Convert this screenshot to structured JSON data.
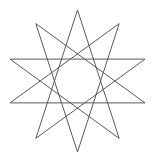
{
  "figure": {
    "shape_kind": "star-polygon",
    "point_count": 10,
    "component_polygons": 2,
    "points_per_polygon": 5,
    "polygon_step": 2,
    "rotation_offset_degrees": 36,
    "background_color": "#ffffff",
    "stroke_color": "#5a5a5a",
    "stroke_width_px": 1,
    "fill": "none",
    "geometry": {
      "center_x": 77.5,
      "center_y": 81,
      "outer_radius": 71,
      "start_angle_degrees": -90,
      "canvas_width": 155,
      "canvas_height": 159
    },
    "vertices": [
      {
        "index": 0,
        "angle": -90,
        "x": 77.5,
        "y": 10.0,
        "label": "top-apex"
      },
      {
        "index": 1,
        "angle": -54,
        "x": 119.2,
        "y": 23.6,
        "label": "upper-right"
      },
      {
        "index": 2,
        "angle": -18,
        "x": 145.0,
        "y": 59.1,
        "label": "right-upper"
      },
      {
        "index": 3,
        "angle": 18,
        "x": 145.0,
        "y": 102.9,
        "label": "right-lower"
      },
      {
        "index": 4,
        "angle": 54,
        "x": 119.2,
        "y": 138.4,
        "label": "lower-right"
      },
      {
        "index": 5,
        "angle": 90,
        "x": 77.5,
        "y": 152.0,
        "label": "bottom-apex"
      },
      {
        "index": 6,
        "angle": 126,
        "x": 35.8,
        "y": 138.4,
        "label": "lower-left"
      },
      {
        "index": 7,
        "angle": 162,
        "x": 10.0,
        "y": 102.9,
        "label": "left-lower"
      },
      {
        "index": 8,
        "angle": 198,
        "x": 10.0,
        "y": 59.1,
        "label": "left-upper"
      },
      {
        "index": 9,
        "angle": 234,
        "x": 35.8,
        "y": 23.6,
        "label": "upper-left"
      }
    ],
    "polygon_a_vertex_order": [
      0,
      4,
      8,
      2,
      6
    ],
    "polygon_b_vertex_order": [
      1,
      5,
      9,
      3,
      7
    ]
  }
}
